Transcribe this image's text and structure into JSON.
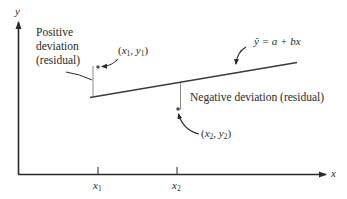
{
  "diagram": {
    "axes": {
      "x_label": "x",
      "y_label": "y",
      "ticks": [
        {
          "name": "x",
          "sub": "1"
        },
        {
          "name": "x",
          "sub": "2"
        }
      ]
    },
    "regression_line": {
      "equation": "ŷ = a + bx",
      "equation_parts": {
        "yhat": "ŷ",
        "rest": "= a + bx"
      }
    },
    "points": [
      {
        "label": "(x1, y1)",
        "x_name": "x",
        "x_sub": "1",
        "y_name": "y",
        "y_sub": "1",
        "position": "above line"
      },
      {
        "label": "(x2, y2)",
        "x_name": "x",
        "x_sub": "2",
        "y_name": "y",
        "y_sub": "2",
        "position": "below line"
      }
    ],
    "annotations": {
      "positive_deviation": [
        "Positive",
        "deviation",
        "(residual)"
      ],
      "negative_deviation": "Negative deviation (residual)"
    },
    "colors": {
      "line": "#3a3a3a",
      "point": "#555555",
      "residual": "#8a8a8a",
      "text": "#2a2a2a"
    }
  }
}
